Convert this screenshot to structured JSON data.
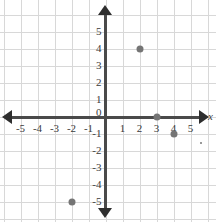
{
  "chart_data": {
    "type": "scatter",
    "title": "",
    "xlabel": "x",
    "ylabel": "",
    "xlim": [
      -6,
      6
    ],
    "ylim": [
      -6,
      6
    ],
    "grid": true,
    "legend": "none",
    "x_tick_labels": [
      "-5",
      "-4",
      "-3",
      "-2",
      "-1",
      "1",
      "2",
      "3",
      "4",
      "5"
    ],
    "x_tick_values": [
      -5,
      -4,
      -3,
      -2,
      -1,
      1,
      2,
      3,
      4,
      5
    ],
    "y_tick_labels": [
      "5",
      "4",
      "3",
      "2",
      "1",
      "-1",
      "-2",
      "-3",
      "-4",
      "-5"
    ],
    "y_tick_values": [
      5,
      4,
      3,
      2,
      1,
      -1,
      -2,
      -3,
      -4,
      -5
    ],
    "origin_label": "0",
    "points": [
      {
        "label": "(2, 4)",
        "x": 2,
        "y": 4
      },
      {
        "label": "(3, 0)",
        "x": 3,
        "y": 0
      },
      {
        "label": "(4, -1)",
        "x": 4,
        "y": -1
      },
      {
        "label": "(-2, -5)",
        "x": -2,
        "y": -5
      }
    ],
    "marker_color": "#757575",
    "grid_color": "#d8d8d8",
    "axis_color": "#3a3a3a",
    "artifacts": [
      {
        "x": 5.55,
        "y": -1.45
      }
    ]
  },
  "axis_labels": {
    "x_axis_name": "x"
  }
}
